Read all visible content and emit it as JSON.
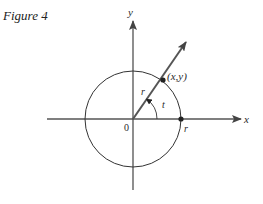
{
  "figure": {
    "caption": "Figure 4",
    "labels": {
      "x_axis": "x",
      "y_axis": "y",
      "origin": "0",
      "point": "(x,y)",
      "radius_on_ray": "r",
      "radius_on_axis": "r",
      "angle": "t"
    },
    "colors": {
      "ink": "#2a2a2a",
      "axis": "#555555",
      "background": "#ffffff"
    },
    "geometry": {
      "origin": [
        133,
        119
      ],
      "circle_radius": 48,
      "point_on_circle": [
        163,
        81
      ],
      "ray_tip": [
        186,
        42
      ],
      "angle_arc_radius": 24
    }
  }
}
